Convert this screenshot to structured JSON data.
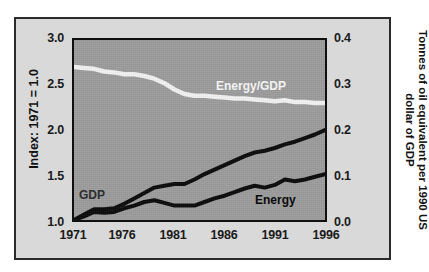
{
  "figure": {
    "panel_background": "#d9d9d9",
    "plot_background": "#9c9c9c",
    "frame_color": "#2b2b2b"
  },
  "axes": {
    "left": {
      "title": "Index: 1971 = 1.0",
      "ticks": [
        "1.0",
        "1.5",
        "2.0",
        "2.5",
        "3.0"
      ],
      "min": 1.0,
      "max": 3.0
    },
    "right": {
      "title": "Tonnes of oil equivalent per 1990 US dollar of GDP",
      "ticks": [
        "0.0",
        "0.1",
        "0.2",
        "0.3",
        "0.4"
      ],
      "min": 0.0,
      "max": 0.4
    },
    "bottom": {
      "ticks": [
        "1971",
        "1976",
        "1981",
        "1986",
        "1991",
        "1996"
      ],
      "min": 1971,
      "max": 1996
    }
  },
  "series_labels": {
    "energy_gdp": "Energy/GDP",
    "gdp": "GDP",
    "energy": "Energy"
  },
  "chart_data": {
    "type": "line",
    "title": "",
    "subtitle": "",
    "xlabel": "",
    "ylabel": "Index: 1971 = 1.0",
    "y2label": "Tonnes of oil equivalent per 1990 US dollar of GDP",
    "xlim": [
      1971,
      1996
    ],
    "ylim": [
      1.0,
      3.0
    ],
    "y2lim": [
      0.0,
      0.4
    ],
    "xticks": [
      1971,
      1976,
      1981,
      1986,
      1991,
      1996
    ],
    "yticks": [
      1.0,
      1.5,
      2.0,
      2.5,
      3.0
    ],
    "y2ticks": [
      0.0,
      0.1,
      0.2,
      0.3,
      0.4
    ],
    "grid": false,
    "legend": "inline-annotations",
    "x": [
      1971,
      1972,
      1973,
      1974,
      1975,
      1976,
      1977,
      1978,
      1979,
      1980,
      1981,
      1982,
      1983,
      1984,
      1985,
      1986,
      1987,
      1988,
      1989,
      1990,
      1991,
      1992,
      1993,
      1994,
      1995,
      1996
    ],
    "series": [
      {
        "name": "GDP",
        "axis": "left",
        "color": "#0a0a0a",
        "values": [
          1.0,
          1.06,
          1.12,
          1.12,
          1.13,
          1.18,
          1.24,
          1.3,
          1.36,
          1.38,
          1.4,
          1.4,
          1.45,
          1.51,
          1.56,
          1.61,
          1.66,
          1.71,
          1.75,
          1.77,
          1.8,
          1.84,
          1.87,
          1.91,
          1.95,
          2.0
        ]
      },
      {
        "name": "Energy",
        "axis": "left",
        "color": "#0a0a0a",
        "values": [
          1.0,
          1.04,
          1.09,
          1.08,
          1.09,
          1.13,
          1.16,
          1.2,
          1.22,
          1.19,
          1.16,
          1.16,
          1.16,
          1.2,
          1.24,
          1.27,
          1.31,
          1.35,
          1.38,
          1.36,
          1.39,
          1.45,
          1.43,
          1.45,
          1.48,
          1.51
        ]
      },
      {
        "name": "Energy/GDP",
        "axis": "left-rendered",
        "color": "#f2f2f2",
        "values": [
          2.7,
          2.69,
          2.68,
          2.65,
          2.64,
          2.62,
          2.62,
          2.6,
          2.57,
          2.52,
          2.45,
          2.4,
          2.38,
          2.38,
          2.37,
          2.36,
          2.35,
          2.35,
          2.34,
          2.33,
          2.32,
          2.33,
          2.31,
          2.31,
          2.3,
          2.3
        ]
      }
    ]
  }
}
